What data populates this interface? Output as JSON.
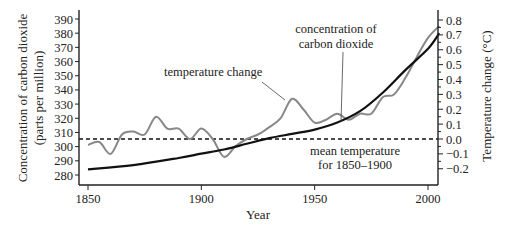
{
  "chart_data": {
    "type": "line",
    "title": "",
    "xlabel": "Year",
    "ylabel_left": "Concentration of carbon dioxide (parts per million)",
    "ylabel_left_lines": [
      "Concentration of carbon dioxide",
      "(parts per million)"
    ],
    "ylabel_right": "Temperature change (°C)",
    "xlim": [
      1845,
      2008
    ],
    "ylim_left": [
      275,
      392
    ],
    "ylim_right": [
      -0.27,
      0.82
    ],
    "x_ticks": [
      1850,
      1900,
      1950,
      2000
    ],
    "y_ticks_left": [
      280,
      290,
      300,
      310,
      320,
      330,
      340,
      350,
      360,
      370,
      380,
      390
    ],
    "y_ticks_right": [
      0.8,
      0.7,
      0.6,
      0.5,
      0.4,
      0.3,
      0.2,
      0.1,
      0.0,
      -0.1,
      -0.2
    ],
    "y_ticks_right_labels": [
      "0.8",
      "0.7",
      "0.6",
      "0.5",
      "0.4",
      "0.3",
      "0.2",
      "0.1",
      "0.0",
      "−0.1",
      "−0.2"
    ],
    "grid": false,
    "legend": "none (inline annotations)",
    "series": [
      {
        "name": "concentration of carbon dioxide",
        "axis": "left",
        "color": "#111111",
        "x": [
          1850,
          1870,
          1890,
          1900,
          1910,
          1920,
          1930,
          1940,
          1950,
          1960,
          1970,
          1980,
          1990,
          2000,
          2005
        ],
        "values": [
          284,
          287,
          292,
          295,
          298,
          302,
          306,
          309,
          312,
          317,
          325,
          338,
          354,
          369,
          380
        ]
      },
      {
        "name": "temperature change",
        "axis": "right",
        "color": "#888888",
        "x": [
          1850,
          1855,
          1860,
          1865,
          1870,
          1875,
          1880,
          1885,
          1890,
          1895,
          1900,
          1905,
          1910,
          1915,
          1920,
          1925,
          1930,
          1935,
          1940,
          1945,
          1950,
          1955,
          1960,
          1965,
          1970,
          1975,
          1980,
          1985,
          1990,
          1995,
          2000,
          2005
        ],
        "values": [
          -0.04,
          -0.02,
          -0.1,
          0.03,
          0.05,
          0.03,
          0.15,
          0.07,
          0.07,
          0.0,
          0.07,
          0.0,
          -0.12,
          -0.05,
          0.0,
          0.03,
          0.08,
          0.14,
          0.27,
          0.2,
          0.11,
          0.13,
          0.17,
          0.13,
          0.17,
          0.17,
          0.28,
          0.3,
          0.41,
          0.55,
          0.68,
          0.76
        ]
      },
      {
        "name": "mean temperature for 1850–1900",
        "axis": "right",
        "style": "dashed",
        "color": "#111111",
        "values": [
          0.0,
          0.0
        ]
      }
    ],
    "annotations": [
      {
        "text": "temperature change",
        "target": "temperature curve near 1940"
      },
      {
        "text_lines": [
          "concentration of",
          "carbon dioxide"
        ],
        "target": "CO2 curve near 1963"
      },
      {
        "text_lines": [
          "mean temperature",
          "for 1850–1900"
        ],
        "target": "dashed zero line"
      }
    ]
  },
  "labels": {
    "xlabel": "Year",
    "ylabel_left_1": "Concentration of carbon dioxide",
    "ylabel_left_2": "(parts per million)",
    "ylabel_right": "Temperature change (°C)",
    "ann_temp": "temperature change",
    "ann_co2_1": "concentration of",
    "ann_co2_2": "carbon dioxide",
    "ann_mean_1": "mean temperature",
    "ann_mean_2": "for 1850–1900"
  }
}
